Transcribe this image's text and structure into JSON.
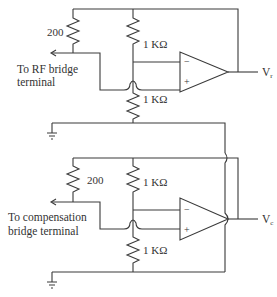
{
  "diagram": {
    "type": "circuit-schematic",
    "circuits": [
      {
        "id": "rf",
        "resistor_shunt_label": "200",
        "resistor_top_label": "1 KΩ",
        "resistor_bottom_label": "1 KΩ",
        "terminal_label_line1": "To RF bridge",
        "terminal_label_line2": "terminal",
        "opamp_minus": "−",
        "opamp_plus": "+",
        "output_label": "V",
        "output_subscript": "r"
      },
      {
        "id": "compensation",
        "resistor_shunt_label": "200",
        "resistor_top_label": "1 KΩ",
        "resistor_bottom_label": "1 KΩ",
        "terminal_label_line1": "To compensation",
        "terminal_label_line2": "bridge terminal",
        "opamp_minus": "−",
        "opamp_plus": "+",
        "output_label": "V",
        "output_subscript": "c"
      }
    ],
    "colors": {
      "line": "#3a3a3a",
      "text": "#333333",
      "background": "#ffffff"
    }
  }
}
